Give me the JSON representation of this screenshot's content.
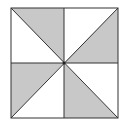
{
  "diagram": {
    "title": "",
    "colors": {
      "background": "#ffffff",
      "shade": "#c8c8c8",
      "stroke": "#333333"
    },
    "shaded_triangles": [
      "top-left-upper",
      "top-right-lower",
      "bottom-left-upper",
      "bottom-right-lower"
    ],
    "triangle_count": 8,
    "shaded_count": 4
  }
}
